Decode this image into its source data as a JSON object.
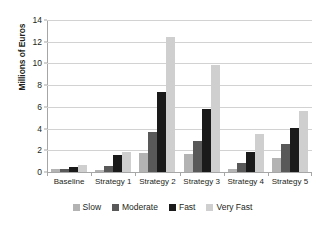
{
  "chart_data": {
    "type": "bar",
    "title": "",
    "subtitle": "",
    "xlabel": "",
    "ylabel": "Millions of Euros",
    "ylim": [
      0,
      14
    ],
    "ytick_step": 2,
    "yticks": [
      0,
      2,
      4,
      6,
      8,
      10,
      12,
      14
    ],
    "ytick_labels": [
      "0",
      "2",
      "4",
      "6",
      "8",
      "10",
      "12",
      "14"
    ],
    "grid": true,
    "grid_axis": "y",
    "legend_position": "bottom",
    "categories": [
      "Baseline",
      "Strategy 1",
      "Strategy 2",
      "Strategy 3",
      "Strategy 4",
      "Strategy 5"
    ],
    "series": [
      {
        "name": "Slow",
        "color": "#b3b3b3",
        "values": [
          0.3,
          0.2,
          1.75,
          1.65,
          0.3,
          1.3
        ]
      },
      {
        "name": "Moderate",
        "color": "#595959",
        "values": [
          0.3,
          0.6,
          3.7,
          2.85,
          0.8,
          2.6
        ]
      },
      {
        "name": "Fast",
        "color": "#1a1a1a",
        "values": [
          0.45,
          1.55,
          7.4,
          5.8,
          1.8,
          4.05
        ]
      },
      {
        "name": "Very Fast",
        "color": "#cfcfcf",
        "values": [
          0.65,
          1.8,
          12.4,
          9.85,
          3.5,
          5.65
        ]
      }
    ]
  },
  "axis": {
    "y_title": "Millions of Euros"
  },
  "colors": {
    "background": "#ffffff",
    "gridline": "#d2d2d2",
    "axis_line": "#a6a6a6",
    "text": "#231f20"
  }
}
